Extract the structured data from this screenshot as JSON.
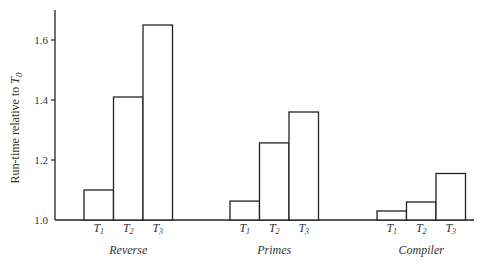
{
  "chart_data": {
    "type": "bar",
    "title": "",
    "xlabel": "",
    "ylabel": "Run-time relative to T0",
    "ylabel_parts": {
      "main": "Run-time relative to ",
      "var": "T",
      "sub": "0"
    },
    "ylim": [
      1.0,
      1.7
    ],
    "yticks": [
      1.0,
      1.2,
      1.4,
      1.6
    ],
    "ytick_labels": [
      "1.0",
      "1.2",
      "1.4",
      "1.6"
    ],
    "grid": false,
    "legend": null,
    "categories": [
      "Reverse",
      "Primes",
      "Compiler"
    ],
    "bar_labels": [
      {
        "var": "T",
        "sub": "1"
      },
      {
        "var": "T",
        "sub": "2"
      },
      {
        "var": "T",
        "sub": "3"
      }
    ],
    "series": [
      {
        "name": "T1",
        "values": [
          1.1,
          1.063,
          1.03
        ]
      },
      {
        "name": "T2",
        "values": [
          1.41,
          1.257,
          1.06
        ]
      },
      {
        "name": "T3",
        "values": [
          1.65,
          1.36,
          1.155
        ]
      }
    ]
  },
  "layout": {
    "axis_x": 55,
    "baseline_y": 220,
    "top_y": 10,
    "baseline_end_x": 474,
    "px_per_unit": 300,
    "bar_width": 29.5,
    "group_starts": [
      84,
      230,
      377
    ],
    "colors": {
      "stroke": "#222222",
      "fill": "#ffffff"
    }
  }
}
